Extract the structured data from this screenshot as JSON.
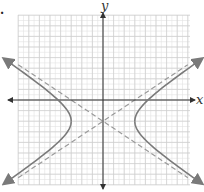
{
  "figure": {
    "bullet": ".",
    "x_axis_label": "x",
    "y_axis_label": "y"
  },
  "colors": {
    "grid": "#e2e2e2",
    "grid_major": "#cfcfcf",
    "axis": "#333333",
    "curve": "#7a7a7a",
    "asymptote": "#9a9a9a"
  },
  "chart_data": {
    "type": "line",
    "title": "",
    "xlabel": "x",
    "ylabel": "y",
    "xlim": [
      -8,
      8
    ],
    "ylim": [
      -8,
      8
    ],
    "grid": true,
    "hyperbola": {
      "equation": "x^2/9 - (y+2)^2/4 = 1",
      "center": [
        0,
        -2
      ],
      "a": 3,
      "b": 2,
      "vertices": [
        [
          -3,
          -2
        ],
        [
          3,
          -2
        ]
      ],
      "orientation": "horizontal"
    },
    "asymptotes": [
      {
        "equation": "y + 2 = (2/3)x",
        "style": "dashed"
      },
      {
        "equation": "y + 2 = -(2/3)x",
        "style": "dashed"
      }
    ]
  }
}
